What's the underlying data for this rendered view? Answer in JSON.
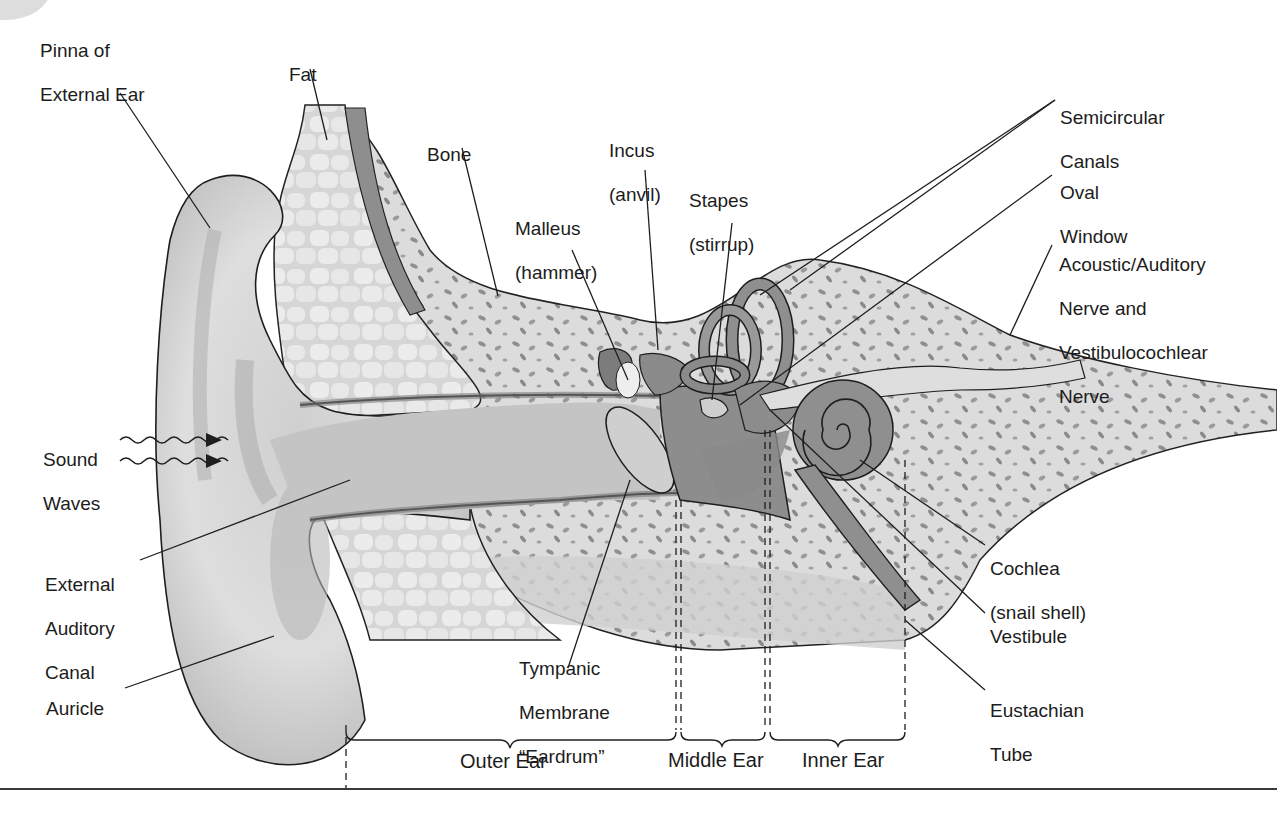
{
  "diagram": {
    "labels": {
      "pinna": [
        "Pinna of",
        "External Ear"
      ],
      "fat": [
        "Fat"
      ],
      "bone": [
        "Bone"
      ],
      "incus": [
        "Incus",
        "(anvil)"
      ],
      "malleus": [
        "Malleus",
        "(hammer)"
      ],
      "stapes": [
        "Stapes",
        "(stirrup)"
      ],
      "semicircular_canals": [
        "Semicircular",
        "Canals"
      ],
      "oval_window": [
        "Oval",
        "Window"
      ],
      "acoustic_nerve": [
        "Acoustic/Auditory",
        "Nerve and",
        "Vestibulocochlear",
        "Nerve"
      ],
      "sound_waves": [
        "Sound",
        "Waves"
      ],
      "external_auditory_canal": [
        "External",
        "Auditory",
        "Canal"
      ],
      "auricle": [
        "Auricle"
      ],
      "tympanic_membrane": [
        "Tympanic",
        "Membrane",
        "“Eardrum”"
      ],
      "cochlea": [
        "Cochlea",
        "(snail shell)"
      ],
      "vestibule": [
        "Vestibule"
      ],
      "eustachian_tube": [
        "Eustachian",
        "Tube"
      ]
    },
    "regions": {
      "outer": "Outer Ear",
      "middle": "Middle Ear",
      "inner": "Inner Ear"
    },
    "colors": {
      "skin": "#d9d9d9",
      "skin_dark": "#a9a9a9",
      "fat": "#e4e4e4",
      "bone": "#dcdcdc",
      "bone_spots": "#8c8c8c",
      "ossicles": "#8a8a8a",
      "outline": "#1e1e1e",
      "text": "#1c1c1c"
    }
  }
}
